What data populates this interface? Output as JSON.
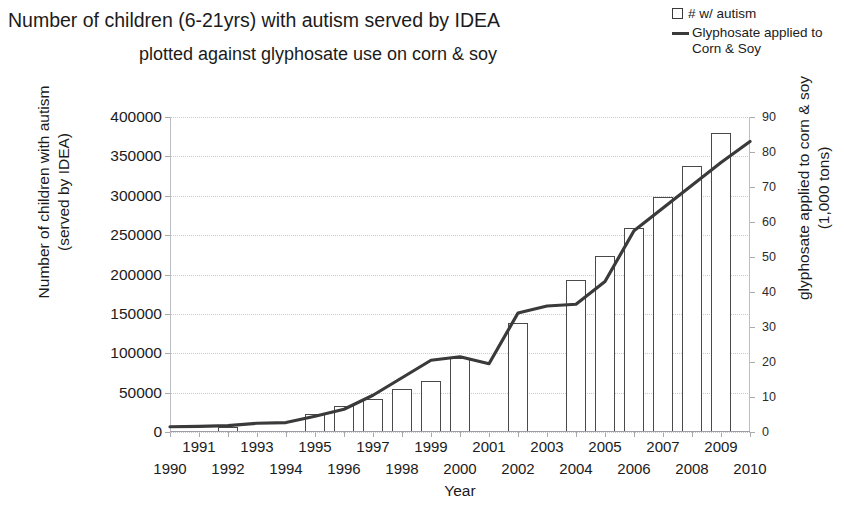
{
  "title": {
    "line1": "Number of children (6-21yrs) with autism served by IDEA",
    "line2": "plotted against glyphosate use on corn & soy"
  },
  "legend": {
    "items": [
      {
        "marker": "box",
        "label": "# w/ autism",
        "label2": ""
      },
      {
        "marker": "line",
        "label": "Glyphosate applied to",
        "label2": "Corn & Soy"
      }
    ]
  },
  "axes": {
    "y_left_title_line1": "Number of children with autism",
    "y_left_title_line2": "(served by IDEA)",
    "y_right_title_line1": "glyphosate applied to corn & soy",
    "y_right_title_line2": "(1,000 tons)",
    "x_title": "Year",
    "y_left_ticks": [
      "0",
      "50000",
      "100000",
      "150000",
      "200000",
      "250000",
      "300000",
      "350000",
      "400000"
    ],
    "y_right_ticks": [
      "0",
      "10",
      "20",
      "30",
      "40",
      "50",
      "60",
      "70",
      "80",
      "90"
    ],
    "x_ticks": [
      "1990",
      "1991",
      "1992",
      "1993",
      "1994",
      "1995",
      "1996",
      "1997",
      "1998",
      "1999",
      "2000",
      "2001",
      "2002",
      "2003",
      "2004",
      "2005",
      "2006",
      "2007",
      "2008",
      "2009",
      "2010"
    ]
  },
  "colors": {
    "bar_stroke": "#4a4a4a",
    "bar_fill": "#ffffff",
    "line": "#3a3a3a",
    "grid": "#c9c9cf",
    "text": "#1b1b1b",
    "background": "#ffffff"
  },
  "chart_data": {
    "type": "bar",
    "title": "Number of children (6-21yrs) with autism served by IDEA plotted against glyphosate use on corn & soy",
    "xlabel": "Year",
    "ylabel": "Number of children with autism (served by IDEA)",
    "y2label": "glyphosate applied to corn & soy (1,000 tons)",
    "grid": true,
    "legend_position": "top-right",
    "x": [
      1990,
      1991,
      1992,
      1993,
      1994,
      1995,
      1996,
      1997,
      1998,
      1999,
      2000,
      2001,
      2002,
      2003,
      2004,
      2005,
      2006,
      2007,
      2008,
      2009,
      2010
    ],
    "xlim": [
      1990,
      2010
    ],
    "ylim": [
      0,
      400000
    ],
    "y2lim": [
      0,
      90
    ],
    "series": [
      {
        "name": "# w/ autism",
        "type": "bar",
        "axis": "left",
        "categories": [
          1990,
          1991,
          1992,
          1993,
          1994,
          1995,
          1996,
          1997,
          1998,
          1999,
          2000,
          2001,
          2002,
          2003,
          2004,
          2005,
          2006,
          2007,
          2008,
          2009,
          2010
        ],
        "values": [
          null,
          null,
          6000,
          null,
          null,
          23000,
          33000,
          42000,
          54000,
          65000,
          94000,
          null,
          138000,
          null,
          193000,
          224000,
          259000,
          298000,
          338000,
          380000,
          null
        ]
      },
      {
        "name": "Glyphosate applied to Corn & Soy",
        "type": "line",
        "axis": "right",
        "x": [
          1990,
          1991,
          1992,
          1993,
          1994,
          1995,
          1996,
          1997,
          1998,
          1999,
          2000,
          2001,
          2002,
          2003,
          2004,
          2005,
          2006,
          2007,
          2008,
          2009,
          2010
        ],
        "values": [
          1.5,
          1.6,
          1.8,
          2.5,
          2.7,
          4.5,
          6.5,
          10.5,
          15.5,
          20.5,
          21.5,
          19.5,
          34.0,
          36.0,
          36.5,
          43.0,
          57.5,
          64.0,
          70.5,
          77.0,
          83.0
        ]
      }
    ]
  }
}
